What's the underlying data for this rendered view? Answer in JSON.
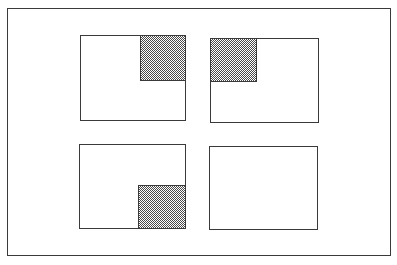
{
  "diagram": {
    "colors": {
      "line": "#3a3a3a",
      "shade_pattern": "#4a4a4a",
      "background": "#ffffff"
    },
    "frame": {
      "x": 7,
      "y": 8,
      "width": 384,
      "height": 248
    },
    "panels": [
      {
        "id": "top-left",
        "rect": {
          "x": 80,
          "y": 35,
          "width": 106,
          "height": 86
        },
        "shaded_quadrant": "top-right",
        "shade": {
          "x": 140,
          "y": 36,
          "width": 46,
          "height": 45
        }
      },
      {
        "id": "top-right",
        "rect": {
          "x": 210,
          "y": 38,
          "width": 109,
          "height": 85
        },
        "shaded_quadrant": "top-left",
        "shade": {
          "x": 210,
          "y": 38,
          "width": 47,
          "height": 43
        }
      },
      {
        "id": "bottom-left",
        "rect": {
          "x": 79,
          "y": 144,
          "width": 107,
          "height": 85
        },
        "shaded_quadrant": "bottom-right",
        "shade": {
          "x": 138,
          "y": 185,
          "width": 47,
          "height": 44
        }
      },
      {
        "id": "bottom-right",
        "rect": {
          "x": 209,
          "y": 146,
          "width": 109,
          "height": 84
        },
        "shaded_quadrant": "none",
        "shade": null
      }
    ]
  }
}
